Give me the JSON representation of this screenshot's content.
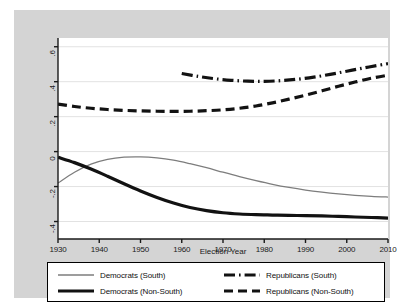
{
  "chart_data": {
    "type": "line",
    "title": "",
    "xlabel": "Election Year",
    "ylabel": "",
    "xlim": [
      1930,
      2010
    ],
    "ylim": [
      -0.5,
      0.65
    ],
    "grid": true,
    "grid_axis": "y",
    "legend_position": "bottom",
    "xticks": [
      "1930",
      "1940",
      "1950",
      "1960",
      "1970",
      "1980",
      "1990",
      "2000",
      "2010"
    ],
    "xtick_values": [
      1930,
      1940,
      1950,
      1960,
      1970,
      1980,
      1990,
      2000,
      2010
    ],
    "yticks": [
      ".6",
      ".4",
      ".2",
      "0",
      "-.2",
      "-.4"
    ],
    "ytick_values": [
      0.6,
      0.4,
      0.2,
      0,
      -0.2,
      -0.4
    ],
    "series": [
      {
        "name": "Democrats (South)",
        "style": "solid-thin-gray",
        "color": "#7d7d7d",
        "width": 1.3,
        "x": [
          1930,
          1934,
          1938,
          1942,
          1946,
          1950,
          1954,
          1958,
          1962,
          1966,
          1970,
          1974,
          1978,
          1982,
          1986,
          1990,
          1994,
          1998,
          2002,
          2006,
          2010
        ],
        "values": [
          -0.18,
          -0.118,
          -0.072,
          -0.045,
          -0.032,
          -0.03,
          -0.036,
          -0.049,
          -0.069,
          -0.092,
          -0.118,
          -0.143,
          -0.166,
          -0.187,
          -0.205,
          -0.22,
          -0.232,
          -0.242,
          -0.25,
          -0.256,
          -0.26
        ]
      },
      {
        "name": "Democrats (Non-South)",
        "style": "solid-thick-black",
        "color": "#121212",
        "width": 3.2,
        "x": [
          1930,
          1934,
          1938,
          1942,
          1946,
          1950,
          1954,
          1958,
          1962,
          1966,
          1970,
          1974,
          1978,
          1982,
          1986,
          1990,
          1994,
          1998,
          2002,
          2006,
          2010
        ],
        "values": [
          -0.032,
          -0.063,
          -0.1,
          -0.141,
          -0.184,
          -0.225,
          -0.262,
          -0.294,
          -0.32,
          -0.338,
          -0.35,
          -0.357,
          -0.361,
          -0.363,
          -0.365,
          -0.366,
          -0.368,
          -0.371,
          -0.374,
          -0.377,
          -0.38
        ]
      },
      {
        "name": "Republicans (South)",
        "style": "dash-dot-thick-black",
        "color": "#121212",
        "width": 3.2,
        "x": [
          1960,
          1964,
          1968,
          1972,
          1976,
          1980,
          1984,
          1988,
          1992,
          1996,
          2000,
          2004,
          2008,
          2010
        ],
        "values": [
          0.447,
          0.43,
          0.417,
          0.408,
          0.403,
          0.402,
          0.406,
          0.414,
          0.426,
          0.442,
          0.46,
          0.478,
          0.495,
          0.503
        ]
      },
      {
        "name": "Republicans (Non-South)",
        "style": "dashed-thick-black",
        "color": "#121212",
        "width": 3.2,
        "x": [
          1930,
          1934,
          1938,
          1942,
          1946,
          1950,
          1954,
          1958,
          1962,
          1966,
          1970,
          1974,
          1978,
          1982,
          1986,
          1990,
          1994,
          1998,
          2002,
          2006,
          2010
        ],
        "values": [
          0.272,
          0.258,
          0.248,
          0.241,
          0.236,
          0.233,
          0.231,
          0.23,
          0.231,
          0.234,
          0.239,
          0.248,
          0.261,
          0.279,
          0.3,
          0.323,
          0.348,
          0.374,
          0.398,
          0.42,
          0.437
        ]
      }
    ]
  },
  "axes": {
    "x_title": "Election Year",
    "x_tick_labels": [
      "1930",
      "1940",
      "1950",
      "1960",
      "1970",
      "1980",
      "1990",
      "2000",
      "2010"
    ],
    "y_tick_labels": [
      ".6",
      ".4",
      ".2",
      "0",
      "-.2",
      "-.4"
    ]
  },
  "legend": {
    "entries": [
      {
        "label": "Democrats (South)",
        "style": "solid-thin-gray"
      },
      {
        "label": "Republicans (South)",
        "style": "dash-dot-thick-black"
      },
      {
        "label": "Democrats (Non-South)",
        "style": "solid-thick-black"
      },
      {
        "label": "Republicans (Non-South)",
        "style": "dashed-thick-black"
      }
    ]
  },
  "colors": {
    "gray_series": "#7d7d7d",
    "black_series": "#121212",
    "panel_background": "#ffffff",
    "figure_background": "#d4d4d4",
    "gridline": "#e2e2e2"
  }
}
